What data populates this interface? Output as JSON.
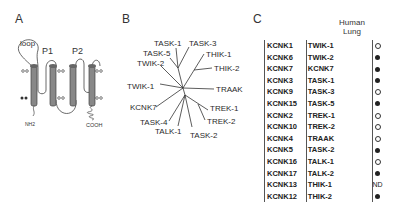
{
  "figure": {
    "panels": {
      "A": {
        "label": "A",
        "title": "Two-pore-domain K+ channel topology",
        "annotations": {
          "loop": "loop",
          "pore1": "P1",
          "pore2": "P2",
          "n_terminus": "NH2",
          "c_terminus": "COOH"
        }
      },
      "B": {
        "label": "B",
        "tree_leaves": [
          "TASK-1",
          "TASK-3",
          "TASK-5",
          "THIK-1",
          "TWIK-2",
          "THIK-2",
          "TWIK-1",
          "TRAAK",
          "KCNK7",
          "TREK-1",
          "TASK-4",
          "TREK-2",
          "TALK-1",
          "TASK-2"
        ]
      },
      "C": {
        "label": "C",
        "column_header": "Human Lung",
        "column_header_line1": "Human",
        "column_header_line2": "Lung",
        "rows": [
          {
            "gene": "KCNK1",
            "protein": "TWIK-1",
            "expression": "open"
          },
          {
            "gene": "KCNK6",
            "protein": "TWIK-2",
            "expression": "filled"
          },
          {
            "gene": "KCNK7",
            "protein": "KCNK7",
            "expression": "filled"
          },
          {
            "gene": "KCNK3",
            "protein": "TASK-1",
            "expression": "filled"
          },
          {
            "gene": "KCNK9",
            "protein": "TASK-3",
            "expression": "open"
          },
          {
            "gene": "KCNK15",
            "protein": "TASK-5",
            "expression": "filled"
          },
          {
            "gene": "KCNK2",
            "protein": "TREK-1",
            "expression": "open"
          },
          {
            "gene": "KCNK10",
            "protein": "TREK-2",
            "expression": "open"
          },
          {
            "gene": "KCNK4",
            "protein": "TRAAK",
            "expression": "open"
          },
          {
            "gene": "KCNK5",
            "protein": "TASK-2",
            "expression": "filled"
          },
          {
            "gene": "KCNK16",
            "protein": "TALK-1",
            "expression": "open"
          },
          {
            "gene": "KCNK17",
            "protein": "TALK-2",
            "expression": "filled"
          },
          {
            "gene": "KCNK13",
            "protein": "THIK-1",
            "expression": "ND"
          },
          {
            "gene": "KCNK12",
            "protein": "THIK-2",
            "expression": "filled"
          }
        ]
      }
    }
  }
}
